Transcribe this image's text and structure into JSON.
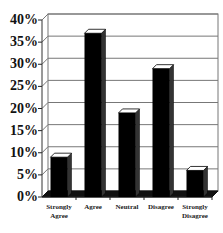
{
  "chart_data": {
    "type": "bar",
    "style": "3d",
    "title": "",
    "xlabel": "",
    "ylabel": "",
    "categories": [
      "Strongly Agree",
      "Agree",
      "Neutral",
      "Disagree",
      "Strongly Disagree"
    ],
    "category_labels": [
      [
        "Strongly",
        "Agree"
      ],
      [
        "Agree"
      ],
      [
        "Neutral"
      ],
      [
        "Disagree"
      ],
      [
        "Strongly",
        "Disagree"
      ]
    ],
    "values": [
      9,
      37,
      19,
      29,
      6
    ],
    "unit": "%",
    "ylim": [
      0,
      40
    ],
    "yticks": [
      "0%",
      "5%",
      "10%",
      "15%",
      "20%",
      "25%",
      "30%",
      "35%",
      "40%"
    ],
    "grid": true,
    "legend": false,
    "bar_color": "#000000"
  }
}
